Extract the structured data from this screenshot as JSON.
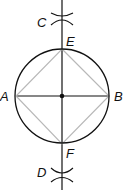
{
  "diagram": {
    "labels": {
      "A": "A",
      "B": "B",
      "C": "C",
      "D": "D",
      "E": "E",
      "F": "F"
    },
    "colors": {
      "construction_lines": "#111111",
      "square_edges": "#b8b8b8",
      "background": "#ffffff"
    },
    "points": {
      "center": [
        62,
        96
      ],
      "A": [
        16,
        96
      ],
      "B": [
        109,
        96
      ],
      "E": [
        62,
        49
      ],
      "F": [
        62,
        144
      ],
      "C": [
        62,
        17
      ],
      "D": [
        62,
        175
      ]
    },
    "circle_radius": 47
  }
}
